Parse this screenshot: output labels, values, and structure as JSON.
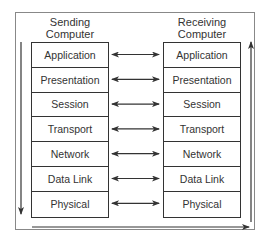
{
  "diagram": {
    "sender": {
      "heading_line1": "Sending",
      "heading_line2": "Computer",
      "layers": [
        "Application",
        "Presentation",
        "Session",
        "Transport",
        "Network",
        "Data Link",
        "Physical"
      ]
    },
    "receiver": {
      "heading_line1": "Receiving",
      "heading_line2": "Computer",
      "layers": [
        "Application",
        "Presentation",
        "Session",
        "Transport",
        "Network",
        "Data Link",
        "Physical"
      ]
    },
    "arrows": {
      "peer": "bidirectional arrows between corresponding layers",
      "sender_flow": "down",
      "medium_flow": "right",
      "receiver_flow": "up"
    },
    "colors": {
      "line": "#333333",
      "frame": "#888888",
      "background": "#ffffff"
    }
  }
}
